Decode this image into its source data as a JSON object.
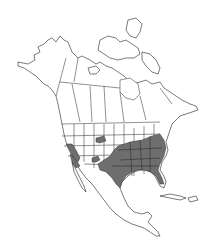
{
  "map": {
    "type": "species-range-map",
    "region": "North America",
    "background_color": "#ffffff",
    "land_color": "#ffffff",
    "outline_color": "#222222",
    "range_color": "#6e6e6e",
    "range_regions": [
      "Southeastern United States",
      "Texas",
      "Southern Great Plains",
      "California / Nevada patch",
      "Arizona patch",
      "Wyoming / Colorado patch"
    ]
  }
}
